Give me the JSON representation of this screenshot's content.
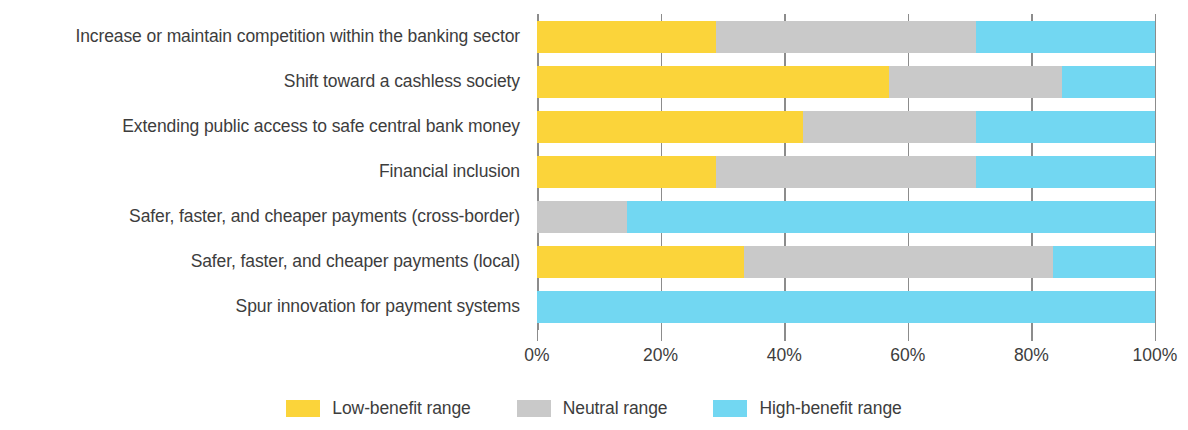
{
  "chart_data": {
    "type": "bar",
    "subtype": "stacked-horizontal-100",
    "title": "",
    "subtitle": "",
    "xlabel": "",
    "ylabel": "",
    "xlim": [
      0,
      100
    ],
    "xticks": [
      0,
      20,
      40,
      60,
      80,
      100
    ],
    "xtick_labels": [
      "0%",
      "20%",
      "40%",
      "60%",
      "80%",
      "100%"
    ],
    "grid": true,
    "legend_position": "bottom-center",
    "categories": [
      "Increase or maintain competition within the banking sector",
      "Shift toward a cashless society",
      "Extending public access to safe central bank money",
      "Financial inclusion",
      "Safer, faster, and cheaper payments (cross-border)",
      "Safer, faster, and cheaper payments (local)",
      "Spur innovation for payment systems"
    ],
    "series": [
      {
        "name": "Low-benefit range",
        "color": "#fbd43a",
        "values": [
          29,
          57,
          43,
          29,
          0,
          33.5,
          0
        ]
      },
      {
        "name": "Neutral range",
        "color": "#c9c9c9",
        "values": [
          42,
          28,
          28,
          42,
          14.5,
          50,
          0
        ]
      },
      {
        "name": "High-benefit range",
        "color": "#72d7f2",
        "values": [
          29,
          15,
          29,
          29,
          85.5,
          16.5,
          100
        ]
      }
    ]
  },
  "legend": {
    "items": [
      {
        "label": "Low-benefit range",
        "color": "#fbd43a",
        "swatch_name": "legend-swatch-low-benefit"
      },
      {
        "label": "Neutral range",
        "color": "#c9c9c9",
        "swatch_name": "legend-swatch-neutral"
      },
      {
        "label": "High-benefit range",
        "color": "#72d7f2",
        "swatch_name": "legend-swatch-high-benefit"
      }
    ]
  }
}
